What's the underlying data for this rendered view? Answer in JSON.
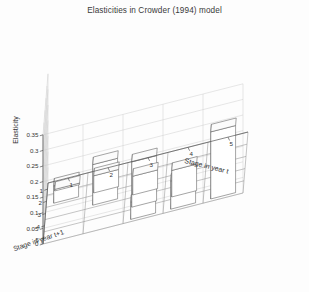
{
  "figure": {
    "title": "Elasticities in Crowder (1994) model",
    "background_color": "#fdfdfd",
    "bar_edge_color": "#5a5a5a",
    "bar_face_color": "#ffffff"
  },
  "chart_data": {
    "type": "bar",
    "title": "Elasticities in Crowder (1994) model",
    "xlabel": "Stage in year t",
    "ylabel": "Stage in year t+1",
    "zlabel": "Elasticity",
    "projection": "3d",
    "grid": true,
    "legend": "none",
    "x_categories": [
      "1",
      "2",
      "3",
      "4",
      "5"
    ],
    "y_categories": [
      "1",
      "2",
      "3",
      "4",
      "5"
    ],
    "zlim": [
      0,
      0.35
    ],
    "zticks": [
      0,
      0.05,
      0.1,
      0.15,
      0.2,
      0.25,
      0.3,
      0.35
    ],
    "ztick_labels": [
      "0",
      "0.05",
      "0.1",
      "0.15",
      "0.2",
      "0.25",
      "0.3",
      "0.35"
    ],
    "matrix_note": "rows = Stage in year t+1 (1..5), cols = Stage in year t (1..5)",
    "values": [
      [
        0.005,
        0.0,
        0.0,
        0.0,
        0.0
      ],
      [
        0.055,
        0.055,
        0.0,
        0.0,
        0.0
      ],
      [
        0.0,
        0.13,
        0.06,
        0.0,
        0.0
      ],
      [
        0.0,
        0.0,
        0.145,
        0.085,
        0.0
      ],
      [
        0.0,
        0.0,
        0.055,
        0.09,
        0.215
      ]
    ],
    "series": [
      {
        "name": "t+1 = 1",
        "values": [
          0.005,
          0.0,
          0.0,
          0.0,
          0.0
        ]
      },
      {
        "name": "t+1 = 2",
        "values": [
          0.055,
          0.055,
          0.0,
          0.0,
          0.0
        ]
      },
      {
        "name": "t+1 = 3",
        "values": [
          0.0,
          0.13,
          0.06,
          0.0,
          0.0
        ]
      },
      {
        "name": "t+1 = 4",
        "values": [
          0.0,
          0.0,
          0.145,
          0.085,
          0.0
        ]
      },
      {
        "name": "t+1 = 5",
        "values": [
          0.0,
          0.0,
          0.055,
          0.09,
          0.215
        ]
      }
    ]
  },
  "axes": {
    "z_axis_title": "Elasticity",
    "z_ticks": [
      "0.35",
      "0.3",
      "0.25",
      "0.2",
      "0.15",
      "0.1",
      "0.05",
      "0"
    ],
    "x_axis_title": "Stage in year t",
    "x_ticks": [
      "1",
      "2",
      "3",
      "4",
      "5"
    ],
    "y_axis_title": "Stage in year t+1",
    "y_ticks": [
      "1",
      "2",
      "3",
      "4",
      "5"
    ]
  }
}
